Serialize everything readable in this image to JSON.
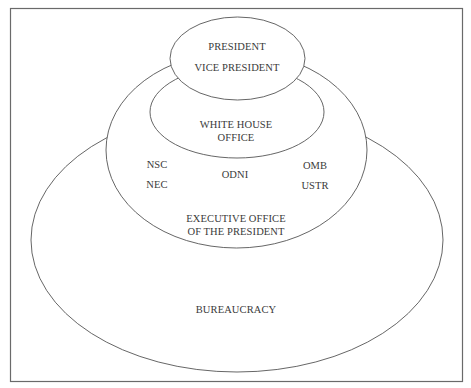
{
  "diagram": {
    "title": "",
    "type": "nested-ellipses",
    "colors": {
      "stroke": "#555555",
      "text": "#3a3a3a",
      "background": "#ffffff"
    },
    "circles": {
      "bureaucracy": {
        "label": "BUREAUCRACY"
      },
      "eop": {
        "label_line1": "EXECUTIVE OFFICE",
        "label_line2": "OF THE PRESIDENT"
      },
      "white_house": {
        "label_line1": "WHITE HOUSE",
        "label_line2": "OFFICE"
      },
      "president": {
        "label_line1": "PRESIDENT",
        "label_line2": "VICE PRESIDENT"
      }
    },
    "eop_members": {
      "left": [
        "NSC",
        "NEC"
      ],
      "center": [
        "ODNI"
      ],
      "right": [
        "OMB",
        "USTR"
      ]
    }
  }
}
